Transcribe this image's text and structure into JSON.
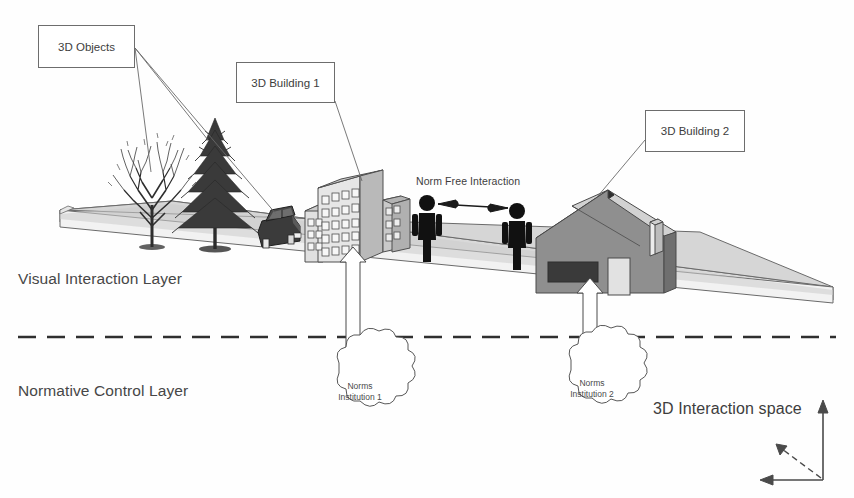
{
  "diagram": {
    "title": "3D Interaction space",
    "layers": [
      {
        "id": "visual",
        "label": "Visual Interaction Layer"
      },
      {
        "id": "normative",
        "label": "Normative Control Layer"
      }
    ],
    "callouts": [
      {
        "id": "objects",
        "label": "3D Objects"
      },
      {
        "id": "building1",
        "label": "3D Building 1"
      },
      {
        "id": "building2",
        "label": "3D Building 2"
      }
    ],
    "annotations": [
      {
        "id": "norm-free",
        "label": "Norm Free Interaction"
      }
    ],
    "clouds": [
      {
        "id": "inst1",
        "line1": "Norms",
        "line2": "Institution 1"
      },
      {
        "id": "inst2",
        "line1": "Norms",
        "line2": "Institution 2"
      }
    ],
    "axis": {
      "label": "3D Interaction space"
    },
    "colors": {
      "ink": "#3f3f3f",
      "outline": "#5c5c5c",
      "ground_top": "#d8d8d8",
      "ground_side": "#efefef",
      "building_face": "#e3e3e3",
      "building_top": "#cfcfcf",
      "building_side": "#bdbdbd",
      "house_wall": "#8c8c8c",
      "house_roof": "#d3d3d3",
      "figure": "#111111",
      "cloud_fill": "#ffffff",
      "arrow_fill": "#ffffff"
    }
  }
}
